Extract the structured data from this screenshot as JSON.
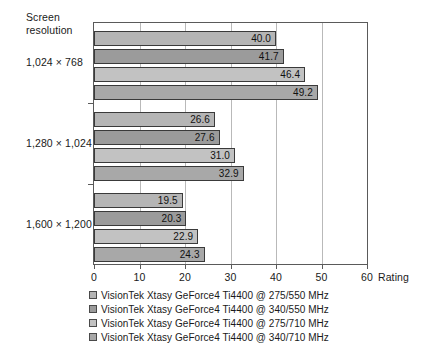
{
  "chart_data": {
    "type": "bar",
    "orientation": "horizontal",
    "title": "",
    "xlabel": "Rating",
    "ylabel": "Screen resolution",
    "categories": [
      "1,024 × 768",
      "1,280 × 1,024",
      "1,600 × 1,200"
    ],
    "xlim": [
      0,
      60
    ],
    "xticks": [
      "0",
      "10",
      "20",
      "30",
      "40",
      "50",
      "60"
    ],
    "grid": true,
    "legend_position": "below",
    "series": [
      {
        "name": "VisionTek Xtasy GeForce4 Ti4400 @ 275/550 MHz",
        "color": "#b5b5b5",
        "values": [
          40.0,
          26.6,
          19.5
        ],
        "labels": [
          "40.0",
          "26.6",
          "19.5"
        ]
      },
      {
        "name": "VisionTek Xtasy GeForce4 Ti4400 @ 340/550 MHz",
        "color": "#9b9b9b",
        "values": [
          41.7,
          27.6,
          20.3
        ],
        "labels": [
          "41.7",
          "27.6",
          "20.3"
        ]
      },
      {
        "name": "VisionTek Xtasy GeForce4 Ti4400 @ 275/710 MHz",
        "color": "#c2c2c2",
        "values": [
          46.4,
          31.0,
          22.9
        ],
        "labels": [
          "46.4",
          "31.0",
          "22.9"
        ]
      },
      {
        "name": "VisionTek Xtasy GeForce4 Ti4400 @ 340/710 MHz",
        "color": "#a8a8a8",
        "values": [
          49.2,
          32.9,
          24.3
        ],
        "labels": [
          "49.2",
          "32.9",
          "24.3"
        ]
      }
    ]
  },
  "axis": {
    "y_title": "Screen\nresolution",
    "x_title": "Rating"
  }
}
